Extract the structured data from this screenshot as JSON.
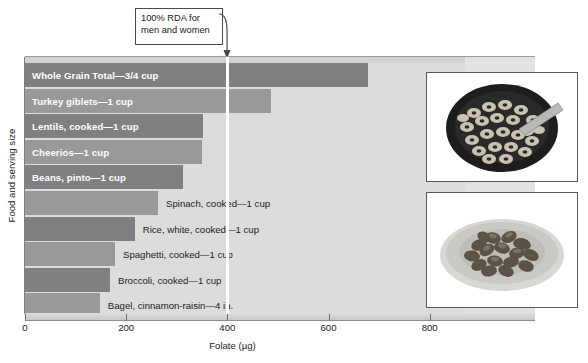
{
  "chart_data": {
    "type": "bar",
    "orientation": "horizontal",
    "title": "",
    "xlabel": "Folate (µg)",
    "ylabel": "Food and serving size",
    "xlim": [
      0,
      870
    ],
    "xticks": [
      0,
      200,
      400,
      600,
      800
    ],
    "xtick_labels": [
      "0",
      "200",
      "400",
      "600",
      "800"
    ],
    "grid": false,
    "legend": "none",
    "categories": [
      "Whole Grain Total—3/4 cup",
      "Turkey giblets—1 cup",
      "Lentils, cooked—1 cup",
      "Cheerios—1 cup",
      "Beans, pinto—1 cup",
      "Spinach, cooked—1 cup",
      "Rice, white, cooked—1 cup",
      "Spaghetti, cooked—1 cup",
      "Broccoli, cooked—1 cup",
      "Bagel, cinnamon-raisin—4 in."
    ],
    "values": [
      678,
      486,
      352,
      350,
      312,
      263,
      217,
      178,
      168,
      148
    ],
    "bar_colors": [
      "#808080",
      "#999999",
      "#808080",
      "#999999",
      "#808080",
      "#999999",
      "#808080",
      "#999999",
      "#808080",
      "#999999"
    ],
    "label_inside": [
      true,
      true,
      true,
      true,
      true,
      false,
      false,
      false,
      false,
      false
    ],
    "annotations": [
      {
        "name": "rda-reference-line",
        "text": "100% RDA for\nmen and women",
        "value": 400,
        "line_color": "#ffffff"
      }
    ]
  },
  "callout": {
    "text": "100% RDA for\nmen and women"
  },
  "axes": {
    "x_title": "Folate (µg)",
    "y_title": "Food and serving size",
    "ticks": [
      {
        "label": "0",
        "value": 0
      },
      {
        "label": "200",
        "value": 200
      },
      {
        "label": "400",
        "value": 400
      },
      {
        "label": "600",
        "value": 600
      },
      {
        "label": "800",
        "value": 800
      }
    ]
  },
  "photos": [
    {
      "name": "cereal-bowl-photo",
      "caption": ""
    },
    {
      "name": "pinto-beans-plate-photo",
      "caption": ""
    }
  ],
  "colors": {
    "plot_background": "#dcdcdc",
    "bar_dark": "#808080",
    "bar_light": "#999999",
    "rda_line": "#ffffff",
    "text": "#1c1c1c"
  }
}
